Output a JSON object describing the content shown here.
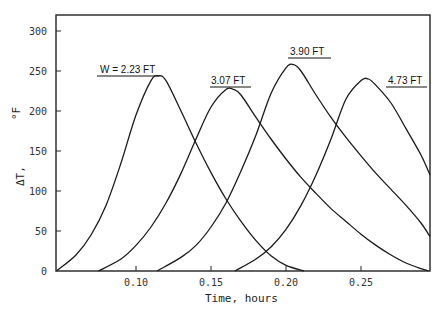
{
  "chart_data": {
    "type": "line",
    "title": "",
    "xlabel": "Time, hours",
    "ylabel": "ΔT, °F",
    "xlim": [
      0.047,
      0.296
    ],
    "ylim": [
      0,
      320
    ],
    "grid": false,
    "legend_position": "inline labels above peaks",
    "x_ticks": [
      0.1,
      0.15,
      0.2,
      0.25
    ],
    "x_tick_labels": [
      "0.10",
      "0.15",
      "0.20",
      "0.25"
    ],
    "y_ticks": [
      0,
      50,
      100,
      150,
      200,
      250,
      300
    ],
    "y_tick_labels": [
      "0",
      "50",
      "100",
      "150",
      "200",
      "250",
      "300"
    ],
    "series": [
      {
        "name": "W = 2.23 FT",
        "x": [
          0.047,
          0.06,
          0.07,
          0.08,
          0.09,
          0.1,
          0.11,
          0.115,
          0.12,
          0.13,
          0.14,
          0.15,
          0.16,
          0.17,
          0.18,
          0.19,
          0.2,
          0.212
        ],
        "y": [
          0,
          20,
          45,
          82,
          135,
          195,
          238,
          244,
          238,
          200,
          160,
          123,
          90,
          62,
          38,
          19,
          7,
          0
        ]
      },
      {
        "name": "3.07 FT",
        "x": [
          0.075,
          0.09,
          0.1,
          0.11,
          0.12,
          0.13,
          0.14,
          0.15,
          0.16,
          0.165,
          0.17,
          0.18,
          0.19,
          0.2,
          0.21,
          0.22,
          0.23,
          0.24,
          0.25,
          0.26,
          0.27,
          0.28,
          0.29,
          0.295
        ],
        "y": [
          0,
          15,
          32,
          55,
          85,
          122,
          165,
          205,
          227,
          227,
          220,
          192,
          165,
          140,
          117,
          97,
          78,
          62,
          46,
          32,
          20,
          10,
          3,
          0
        ]
      },
      {
        "name": "3.90 FT",
        "x": [
          0.114,
          0.13,
          0.14,
          0.15,
          0.16,
          0.17,
          0.18,
          0.19,
          0.2,
          0.205,
          0.21,
          0.22,
          0.23,
          0.24,
          0.25,
          0.26,
          0.27,
          0.28,
          0.29,
          0.296
        ],
        "y": [
          0,
          17,
          32,
          55,
          85,
          125,
          170,
          222,
          254,
          258,
          250,
          220,
          192,
          167,
          144,
          122,
          102,
          82,
          60,
          43
        ]
      },
      {
        "name": "4.73 FT",
        "x": [
          0.166,
          0.18,
          0.19,
          0.2,
          0.21,
          0.22,
          0.23,
          0.24,
          0.25,
          0.255,
          0.26,
          0.27,
          0.28,
          0.29,
          0.296
        ],
        "y": [
          0,
          15,
          30,
          52,
          82,
          120,
          165,
          215,
          238,
          240,
          232,
          210,
          178,
          145,
          120
        ]
      }
    ]
  },
  "labels": {
    "series_0": "W = 2.23 FT",
    "series_1": "3.07 FT",
    "series_2": "3.90 FT",
    "series_3": "4.73 FT",
    "xlabel": "Time, hours",
    "ylabel_main": "ΔT,",
    "ylabel_unit": "°F"
  },
  "style": {
    "line_color": "#1a1a1a",
    "axis_color": "#222222",
    "background": "#ffffff"
  }
}
